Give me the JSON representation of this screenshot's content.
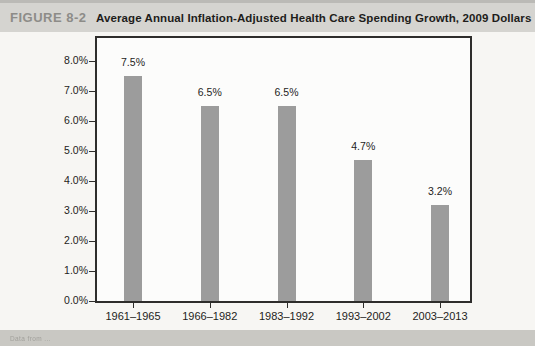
{
  "figure": {
    "label": "FIGURE 8-2",
    "title": "Average Annual Inflation-Adjusted Health Care Spending Growth, 2009 Dollars",
    "caption": "Data from ..."
  },
  "colors": {
    "bar": "#9c9c9c",
    "axis": "#2e2d2b",
    "plot_background": "#fcfcfb",
    "header_band": "#d5d4d0",
    "footer_band": "#c9c8c3",
    "figure_label_text": "#8d8c88",
    "text": "#1e1d1b"
  },
  "chart_data": {
    "type": "bar",
    "title": "Average Annual Inflation-Adjusted Health Care Spending Growth, 2009 Dollars",
    "categories": [
      "1961–1965",
      "1966–1982",
      "1983–1992",
      "1993–2002",
      "2003–2013"
    ],
    "values": [
      7.5,
      6.5,
      6.5,
      4.7,
      3.2
    ],
    "data_labels": [
      "7.5%",
      "6.5%",
      "6.5%",
      "4.7%",
      "3.2%"
    ],
    "xlabel": "",
    "ylabel": "",
    "ylim": [
      0,
      8
    ],
    "y_tick_step": 1,
    "y_tick_labels": [
      "0.0%",
      "1.0%",
      "2.0%",
      "3.0%",
      "4.0%",
      "5.0%",
      "6.0%",
      "7.0%",
      "8.0%"
    ],
    "grid": false,
    "legend": "none",
    "bar_color": "#9c9c9c"
  }
}
